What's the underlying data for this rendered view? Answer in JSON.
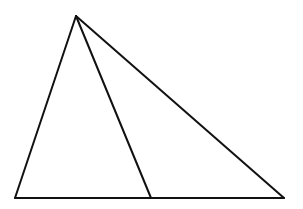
{
  "diagram": {
    "type": "geometry",
    "background": "#ffffff",
    "stroke_color": "#111111",
    "vertices": {
      "apex": [
        76,
        16
      ],
      "base_left": [
        15,
        198
      ],
      "base_right": [
        284,
        198
      ],
      "cevian_foot": [
        151,
        198
      ]
    },
    "segments": [
      {
        "name": "left-side",
        "from": "apex",
        "to": "base_left"
      },
      {
        "name": "right-side",
        "from": "apex",
        "to": "base_right"
      },
      {
        "name": "base",
        "from": "base_left",
        "to": "base_right"
      },
      {
        "name": "cevian",
        "from": "apex",
        "to": "cevian_foot"
      }
    ]
  }
}
